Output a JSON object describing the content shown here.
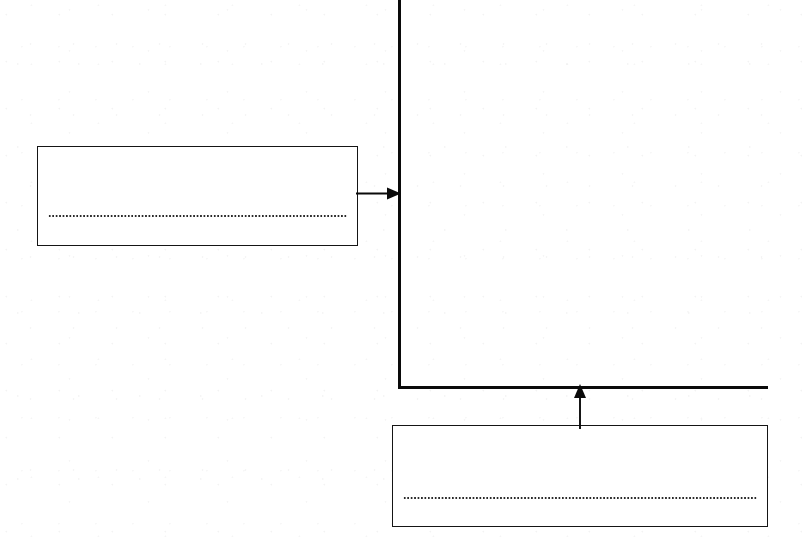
{
  "document": {
    "kind": "scanned-diagram",
    "title": "Axis callout diagram",
    "background_color": "#ffffff",
    "ink_color": "#0a0a0a"
  },
  "axes": {
    "vertical": {
      "name": "y-axis",
      "label": "",
      "color": "#0a0a0a",
      "x": 399,
      "y_start": 0,
      "y_end": 389,
      "thickness": 3
    },
    "horizontal": {
      "name": "x-axis",
      "label": "",
      "color": "#0a0a0a",
      "y": 387,
      "x_start": 399,
      "x_end": 768,
      "thickness": 3
    }
  },
  "callouts": [
    {
      "id": "callout-upper-left",
      "text": "",
      "rule_style": "dotted",
      "points_to": "y-axis",
      "arrow_direction": "right",
      "x": 37,
      "y": 146,
      "width": 321,
      "height": 100
    },
    {
      "id": "callout-lower-right",
      "text": "",
      "rule_style": "dotted",
      "points_to": "x-axis",
      "arrow_direction": "up",
      "x": 392,
      "y": 425,
      "width": 376,
      "height": 102
    }
  ],
  "connectors": [
    {
      "id": "connector-upper",
      "from": "callout-upper-left",
      "to": "y-axis",
      "direction": "right",
      "color": "#0a0a0a"
    },
    {
      "id": "connector-lower",
      "from": "callout-lower-right",
      "to": "x-axis",
      "direction": "up",
      "color": "#0a0a0a"
    }
  ]
}
